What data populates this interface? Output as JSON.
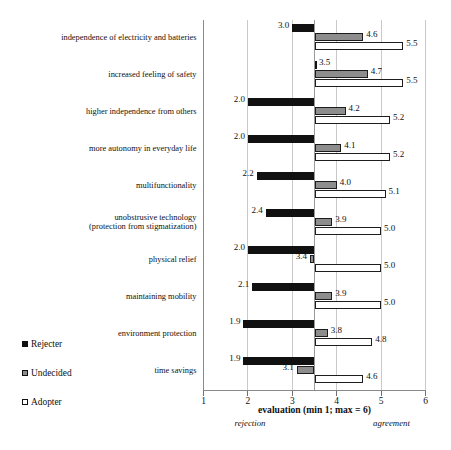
{
  "chart_data": {
    "type": "bar",
    "title": "",
    "xlabel": "evaluation (min 1; max = 6)",
    "ylabel": "",
    "xlim": [
      1,
      6
    ],
    "baseline": 3.5,
    "orientation": "horizontal",
    "grid": true,
    "legend_position": "bottom-left",
    "xticks": [
      "1",
      "2",
      "3",
      "4",
      "5",
      "6"
    ],
    "xtick_values": [
      1,
      2,
      3,
      4,
      5,
      6
    ],
    "left_endnote": "rejection",
    "right_endnote": "agreement",
    "categories": [
      "independence of electricity and batteries",
      "increased feeling of safety",
      "higher independence from others",
      "more autonomy in everyday life",
      "multifunctionality",
      "unobstrusive technology\n(protection from stigmatization)",
      "physical relief",
      "maintaining mobility",
      "environment protection",
      "time savings"
    ],
    "series": [
      {
        "name": "Rejecter",
        "color": "#111111",
        "values": [
          3.0,
          3.5,
          2.0,
          2.0,
          2.2,
          2.4,
          2.0,
          2.1,
          1.9,
          1.9
        ],
        "labels": [
          "3.0",
          "3.5",
          "2.0",
          "2.0",
          "2.2",
          "2.4",
          "2.0",
          "2.1",
          "1.9",
          "1.9"
        ]
      },
      {
        "name": "Undecided",
        "color": "#8d8d8d",
        "values": [
          4.6,
          4.7,
          4.2,
          4.1,
          4.0,
          3.9,
          3.4,
          3.9,
          3.8,
          3.1
        ],
        "labels": [
          "4.6",
          "4.7",
          "4.2",
          "4.1",
          "4.0",
          "3.9",
          "3.4",
          "3.9",
          "3.8",
          "3.1"
        ]
      },
      {
        "name": "Adopter",
        "color": "#ffffff",
        "values": [
          5.5,
          5.5,
          5.2,
          5.2,
          5.1,
          5.0,
          5.0,
          5.0,
          4.8,
          4.6
        ],
        "labels": [
          "5.5",
          "5.5",
          "5.2",
          "5.2",
          "5.1",
          "5.0",
          "5.0",
          "5.0",
          "4.8",
          "4.6"
        ]
      }
    ]
  },
  "legend": {
    "items": [
      {
        "label": "Rejecter",
        "swatch": "rejecter"
      },
      {
        "label": "Undecided",
        "swatch": "undecided"
      },
      {
        "label": "Adopter",
        "swatch": "adopter"
      }
    ]
  },
  "caption": {
    "text": ""
  }
}
